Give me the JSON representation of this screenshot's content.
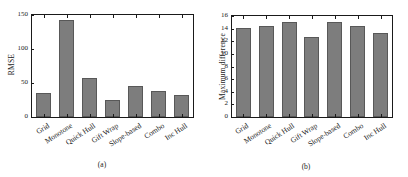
{
  "figure": {
    "background": "#ffffff",
    "bar_color": "#7d7d7d",
    "bar_edge_color": "#585858",
    "axis_color": "#1a1a1a"
  },
  "panels": [
    {
      "caption": "(a)",
      "ylabel": "RMSE"
    },
    {
      "caption": "(b)",
      "ylabel": "Maximum difference"
    }
  ],
  "chart_data": [
    {
      "type": "bar",
      "title": "",
      "xlabel": "",
      "ylabel": "RMSE",
      "categories": [
        "Grid",
        "Monotone",
        "Quick Hull",
        "Gift Wrap",
        "Slope-based",
        "Combo",
        "Inc Hull"
      ],
      "values": [
        36,
        142,
        57,
        25,
        45,
        38,
        33
      ],
      "ylim": [
        0,
        150
      ],
      "yticks": [
        0,
        50,
        100,
        150
      ],
      "ytick_labels": [
        "0",
        "50",
        "100",
        "150"
      ],
      "grid": false,
      "legend": null,
      "caption": "(a)"
    },
    {
      "type": "bar",
      "title": "",
      "xlabel": "",
      "ylabel": "Maximum difference",
      "categories": [
        "Grid",
        "Monotone",
        "Quick Hull",
        "Gift Wrap",
        "Slope-based",
        "Combo",
        "Inc Hull"
      ],
      "values": [
        14.1,
        14.4,
        15.1,
        12.6,
        15.0,
        14.4,
        13.3
      ],
      "ylim": [
        0,
        16
      ],
      "yticks": [
        0,
        2,
        4,
        6,
        8,
        10,
        12,
        14,
        16
      ],
      "ytick_labels": [
        "0",
        "2",
        "4",
        "6",
        "8",
        "10",
        "12",
        "14",
        "16"
      ],
      "grid": false,
      "legend": null,
      "caption": "(b)"
    }
  ]
}
